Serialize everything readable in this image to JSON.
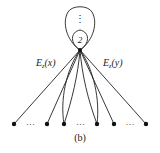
{
  "diagram": {
    "caption": "(b)",
    "edge_label_left": {
      "base": "E",
      "sub": "z",
      "arg": "(x)"
    },
    "edge_label_right": {
      "base": "E",
      "sub": "z",
      "arg": "(y)"
    },
    "inner_loop_label": "2",
    "outer_loop_marker": "⋮",
    "ellipsis": "…",
    "colors": {
      "stroke": "#222222",
      "node": "#111111",
      "background": "#ffffff"
    }
  }
}
